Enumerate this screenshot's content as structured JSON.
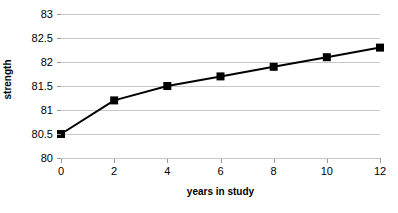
{
  "chart_data": {
    "type": "line",
    "title": "",
    "xlabel": "years in study",
    "ylabel": "strength",
    "x": [
      0,
      2,
      4,
      6,
      8,
      10,
      12
    ],
    "values": [
      80.5,
      81.2,
      81.5,
      81.7,
      81.9,
      82.1,
      82.3
    ],
    "series": [
      {
        "name": "strength",
        "x": [
          0,
          2,
          4,
          6,
          8,
          10,
          12
        ],
        "values": [
          80.5,
          81.2,
          81.5,
          81.7,
          81.9,
          82.1,
          82.3
        ]
      }
    ],
    "xlim": [
      0,
      12
    ],
    "ylim": [
      80,
      83
    ],
    "xticks": [
      0,
      2,
      4,
      6,
      8,
      10,
      12
    ],
    "xtick_labels": [
      "0",
      "2",
      "4",
      "6",
      "8",
      "10",
      "12"
    ],
    "yticks": [
      80,
      80.5,
      81,
      81.5,
      82,
      82.5,
      83
    ],
    "ytick_labels": [
      "80",
      "80.5",
      "81",
      "81.5",
      "82",
      "82.5",
      "83"
    ],
    "grid": "horizontal",
    "legend": "none",
    "line_color": "#000000",
    "marker": "square",
    "marker_color": "#000000",
    "gridline_color": "#c8c8c8",
    "axis_color": "#9a9a9a",
    "background": "#ffffff"
  }
}
